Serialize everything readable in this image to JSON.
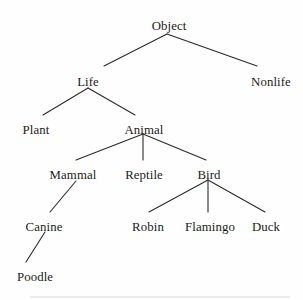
{
  "figure": {
    "background_color": "#fefefe",
    "text_color": "#1b1b1b",
    "edge_color": "#2a2a2a",
    "rule_color": "#d7d7d7"
  },
  "chart_data": {
    "type": "diagram",
    "diagram_type": "hierarchy-tree",
    "title": "",
    "root": "Object",
    "orientation": "top-down",
    "levels": [
      [
        "Object"
      ],
      [
        "Life",
        "Nonlife"
      ],
      [
        "Plant",
        "Animal"
      ],
      [
        "Mammal",
        "Reptile",
        "Bird"
      ],
      [
        "Canine",
        "Robin",
        "Flamingo",
        "Duck"
      ],
      [
        "Poodle"
      ]
    ],
    "nodes": [
      {
        "id": "object",
        "label": "Object",
        "level": 0,
        "x": 169,
        "y": 20
      },
      {
        "id": "life",
        "label": "Life",
        "level": 1,
        "x": 88,
        "y": 76
      },
      {
        "id": "nonlife",
        "label": "Nonlife",
        "level": 1,
        "x": 271,
        "y": 76
      },
      {
        "id": "plant",
        "label": "Plant",
        "level": 2,
        "x": 36,
        "y": 124
      },
      {
        "id": "animal",
        "label": "Animal",
        "level": 2,
        "x": 144,
        "y": 124
      },
      {
        "id": "mammal",
        "label": "Mammal",
        "level": 3,
        "x": 73,
        "y": 169
      },
      {
        "id": "reptile",
        "label": "Reptile",
        "level": 3,
        "x": 144,
        "y": 169
      },
      {
        "id": "bird",
        "label": "Bird",
        "level": 3,
        "x": 209,
        "y": 169
      },
      {
        "id": "canine",
        "label": "Canine",
        "level": 4,
        "x": 44,
        "y": 221
      },
      {
        "id": "robin",
        "label": "Robin",
        "level": 4,
        "x": 148,
        "y": 221
      },
      {
        "id": "flamingo",
        "label": "Flamingo",
        "level": 4,
        "x": 210,
        "y": 221
      },
      {
        "id": "duck",
        "label": "Duck",
        "level": 4,
        "x": 266,
        "y": 221
      },
      {
        "id": "poodle",
        "label": "Poodle",
        "level": 5,
        "x": 35,
        "y": 271
      }
    ],
    "edges": [
      {
        "from": "object",
        "to": "life",
        "x1": 167,
        "y1": 34,
        "x2": 104,
        "y2": 66
      },
      {
        "from": "object",
        "to": "nonlife",
        "x1": 167,
        "y1": 34,
        "x2": 257,
        "y2": 66
      },
      {
        "from": "life",
        "to": "plant",
        "x1": 88,
        "y1": 88,
        "x2": 43,
        "y2": 115
      },
      {
        "from": "life",
        "to": "animal",
        "x1": 88,
        "y1": 88,
        "x2": 135,
        "y2": 115
      },
      {
        "from": "animal",
        "to": "mammal",
        "x1": 143,
        "y1": 134,
        "x2": 76,
        "y2": 160
      },
      {
        "from": "animal",
        "to": "reptile",
        "x1": 143,
        "y1": 134,
        "x2": 143,
        "y2": 160
      },
      {
        "from": "animal",
        "to": "bird",
        "x1": 143,
        "y1": 134,
        "x2": 206,
        "y2": 160
      },
      {
        "from": "mammal",
        "to": "canine",
        "x1": 76,
        "y1": 181,
        "x2": 50,
        "y2": 212
      },
      {
        "from": "bird",
        "to": "robin",
        "x1": 208,
        "y1": 180,
        "x2": 149,
        "y2": 212
      },
      {
        "from": "bird",
        "to": "flamingo",
        "x1": 208,
        "y1": 180,
        "x2": 208,
        "y2": 212
      },
      {
        "from": "bird",
        "to": "duck",
        "x1": 208,
        "y1": 180,
        "x2": 265,
        "y2": 212
      },
      {
        "from": "canine",
        "to": "poodle",
        "x1": 45,
        "y1": 232,
        "x2": 26,
        "y2": 262
      }
    ],
    "page_rule": {
      "x1": 30,
      "y1": 297,
      "x2": 290,
      "y2": 297
    }
  }
}
